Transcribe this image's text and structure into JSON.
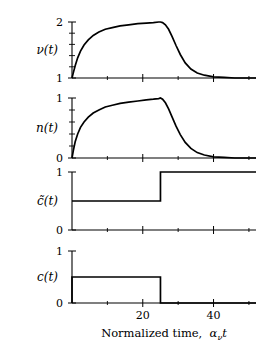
{
  "figure": {
    "xaxis": {
      "label_prefix": "Normalized time,",
      "label_symbol": "α",
      "label_subscript": "ν",
      "label_suffix": "t",
      "label_full": "Normalized time,  ανt",
      "min": 0,
      "max": 52,
      "ticks": [
        20,
        40
      ],
      "tick_labels": [
        "20",
        "40"
      ],
      "minor_ticks": [
        10,
        30,
        50
      ]
    },
    "panels": [
      {
        "name": "nu",
        "ylabel": "ν(t)",
        "ymin": 1,
        "ymax": 2,
        "ytick_labels": [
          "1",
          "2"
        ],
        "ytick_values": [
          1,
          2
        ],
        "minor_tick_count": 4
      },
      {
        "name": "n",
        "ylabel": "n(t)",
        "ymin": 0,
        "ymax": 1,
        "ytick_labels": [
          "0",
          "1"
        ],
        "ytick_values": [
          0,
          1
        ],
        "minor_tick_count": 4
      },
      {
        "name": "c-tilde",
        "ylabel": "c̃(t)",
        "ymin": 0,
        "ymax": 1,
        "ytick_labels": [
          "0",
          "1"
        ],
        "ytick_values": [
          0,
          1
        ],
        "minor_tick_count": 0
      },
      {
        "name": "c",
        "ylabel": "c(t)",
        "ymin": 0,
        "ymax": 1,
        "ytick_labels": [
          "0",
          "1"
        ],
        "ytick_values": [
          0,
          1
        ],
        "minor_tick_count": 0
      }
    ]
  },
  "chart_data": [
    {
      "type": "line",
      "title": "",
      "xlabel": "Normalized time, ανt",
      "ylabel": "ν(t)",
      "xlim": [
        0,
        52
      ],
      "ylim": [
        1,
        2
      ],
      "grid": false,
      "legend": "none",
      "series": [
        {
          "name": "ν(t)",
          "x": [
            0,
            0.4,
            0.9,
            1.6,
            2.4,
            3.4,
            4.6,
            6.0,
            7.6,
            9.4,
            11.4,
            13.6,
            16.0,
            18.6,
            21.0,
            23.0,
            24.5,
            25.0,
            25.6,
            26.4,
            27.3,
            28.3,
            29.4,
            30.6,
            32.0,
            33.6,
            35.4,
            37.4,
            40.0,
            43.0,
            46.0,
            49.0,
            52.0
          ],
          "values": [
            1.0,
            1.1,
            1.22,
            1.36,
            1.48,
            1.59,
            1.68,
            1.76,
            1.82,
            1.87,
            1.9,
            1.93,
            1.95,
            1.97,
            1.98,
            1.99,
            2.0,
            2.0,
            1.99,
            1.95,
            1.87,
            1.74,
            1.58,
            1.42,
            1.27,
            1.16,
            1.09,
            1.05,
            1.02,
            1.01,
            1.0,
            1.0,
            1.0
          ]
        }
      ]
    },
    {
      "type": "line",
      "title": "",
      "xlabel": "Normalized time, ανt",
      "ylabel": "n(t)",
      "xlim": [
        0,
        52
      ],
      "ylim": [
        0,
        1
      ],
      "grid": false,
      "legend": "none",
      "series": [
        {
          "name": "n(t)",
          "x": [
            0,
            0.4,
            0.9,
            1.6,
            2.4,
            3.4,
            4.6,
            6.0,
            7.6,
            9.4,
            11.4,
            13.6,
            16.0,
            18.6,
            21.0,
            23.0,
            24.5,
            25.0,
            25.6,
            26.4,
            27.3,
            28.3,
            29.4,
            30.6,
            32.0,
            33.6,
            35.4,
            37.4,
            40.0,
            43.0,
            46.0,
            49.0,
            52.0
          ],
          "values": [
            0.0,
            0.13,
            0.27,
            0.4,
            0.51,
            0.6,
            0.68,
            0.75,
            0.8,
            0.85,
            0.88,
            0.91,
            0.93,
            0.95,
            0.97,
            0.98,
            0.99,
            1.0,
            0.98,
            0.92,
            0.82,
            0.68,
            0.53,
            0.39,
            0.26,
            0.16,
            0.09,
            0.05,
            0.02,
            0.01,
            0.0,
            0.0,
            0.0
          ]
        }
      ]
    },
    {
      "type": "line",
      "title": "",
      "xlabel": "Normalized time, ανt",
      "ylabel": "c̃(t)",
      "xlim": [
        0,
        52
      ],
      "ylim": [
        0,
        1
      ],
      "grid": false,
      "legend": "none",
      "series": [
        {
          "name": "c̃(t)",
          "x": [
            0,
            25,
            25,
            52
          ],
          "values": [
            0.5,
            0.5,
            1.0,
            1.0
          ]
        }
      ]
    },
    {
      "type": "line",
      "title": "",
      "xlabel": "Normalized time, ανt",
      "ylabel": "c(t)",
      "xlim": [
        0,
        52
      ],
      "ylim": [
        0,
        1
      ],
      "grid": false,
      "legend": "none",
      "series": [
        {
          "name": "c(t)",
          "x": [
            0,
            0,
            25,
            25,
            52
          ],
          "values": [
            0.0,
            0.5,
            0.5,
            0.0,
            0.0
          ]
        }
      ]
    }
  ]
}
